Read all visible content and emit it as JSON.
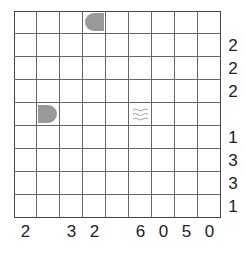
{
  "puzzle": {
    "type": "battleships",
    "rows": 9,
    "cols": 9,
    "row_clues": [
      "",
      "2",
      "2",
      "2",
      "",
      "1",
      "3",
      "3",
      "1"
    ],
    "col_clues": [
      "2",
      "",
      "3",
      "2",
      "",
      "6",
      "0",
      "5",
      "0"
    ],
    "given_cells": [
      {
        "row": 0,
        "col": 3,
        "kind": "ship-left-end"
      },
      {
        "row": 4,
        "col": 1,
        "kind": "ship-right-end"
      },
      {
        "row": 4,
        "col": 5,
        "kind": "water"
      }
    ]
  },
  "colors": {
    "ship": "#999999",
    "grid_line": "#666666",
    "border": "#444444",
    "text": "#222222"
  }
}
